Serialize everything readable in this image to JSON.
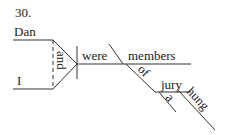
{
  "number": "30.",
  "words": {
    "subject1": "Dan",
    "subject2": "I",
    "conjunction": "and",
    "verb": "were",
    "complement": "members",
    "preposition": "of",
    "object": "jury",
    "article": "a",
    "modifier": "hung"
  }
}
